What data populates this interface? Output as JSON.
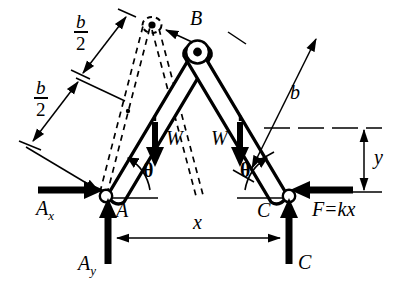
{
  "figure": {
    "type": "mechanics-free-body-diagram",
    "background_color": "#ffffff",
    "ink_color": "#000000"
  },
  "points": {
    "apex": {
      "label": "B",
      "name": "point-b"
    },
    "left_support": {
      "label": "A",
      "name": "point-a"
    },
    "right_support": {
      "label": "C",
      "name": "point-c"
    }
  },
  "dimensions": {
    "half_length_upper": {
      "numerator": "b",
      "denominator": "2"
    },
    "half_length_lower": {
      "numerator": "b",
      "denominator": "2"
    },
    "full_length_right": "b",
    "horizontal_span": "x",
    "vertical_height": "y"
  },
  "angles": {
    "left": "θ",
    "right": "θ"
  },
  "loads": {
    "weight_left": "W",
    "weight_right": "W",
    "spring_force": {
      "symbol": "F",
      "equals": "=",
      "expression": "kx",
      "full": "F = kx"
    }
  },
  "reactions": {
    "ax": {
      "base": "A",
      "sub": "x"
    },
    "ay": {
      "base": "A",
      "sub": "y"
    },
    "c": {
      "base": "C",
      "sub": ""
    }
  }
}
